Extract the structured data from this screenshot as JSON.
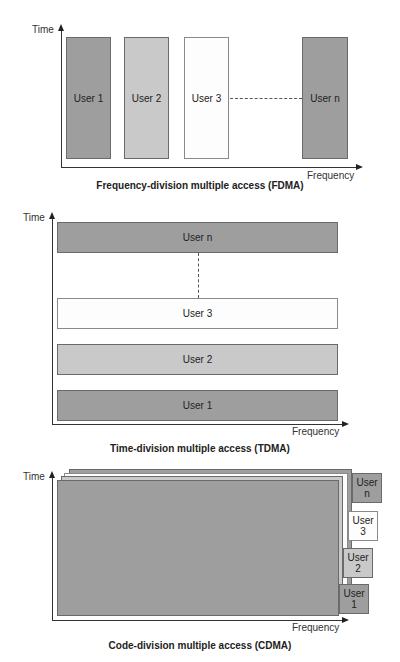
{
  "colors": {
    "dark_block": "#9e9e9e",
    "light_block": "#c9c9c9",
    "white_block": "#fdfdfd",
    "border": "#6a6a6a",
    "axis": "#333333"
  },
  "fdma": {
    "y_axis_label": "Time",
    "x_axis_label": "Frequency",
    "caption": "Frequency-division multiple access (FDMA)",
    "blocks": [
      {
        "label": "User 1",
        "shade": "dark"
      },
      {
        "label": "User 2",
        "shade": "light"
      },
      {
        "label": "User 3",
        "shade": "white"
      },
      {
        "label": "User n",
        "shade": "dark"
      }
    ]
  },
  "tdma": {
    "y_axis_label": "Time",
    "x_axis_label": "Frequency",
    "caption": "Time-division multiple access (TDMA)",
    "blocks": [
      {
        "label": "User n",
        "shade": "dark"
      },
      {
        "label": "User 3",
        "shade": "white"
      },
      {
        "label": "User 2",
        "shade": "light"
      },
      {
        "label": "User 1",
        "shade": "dark"
      }
    ]
  },
  "cdma": {
    "y_axis_label": "Time",
    "x_axis_label": "Frequency",
    "caption": "Code-division multiple access (CDMA)",
    "tabs": [
      {
        "line1": "User",
        "line2": "n",
        "shade": "dark"
      },
      {
        "line1": "User",
        "line2": "3",
        "shade": "white"
      },
      {
        "line1": "User",
        "line2": "2",
        "shade": "light"
      },
      {
        "line1": "User",
        "line2": "1",
        "shade": "dark"
      }
    ]
  }
}
